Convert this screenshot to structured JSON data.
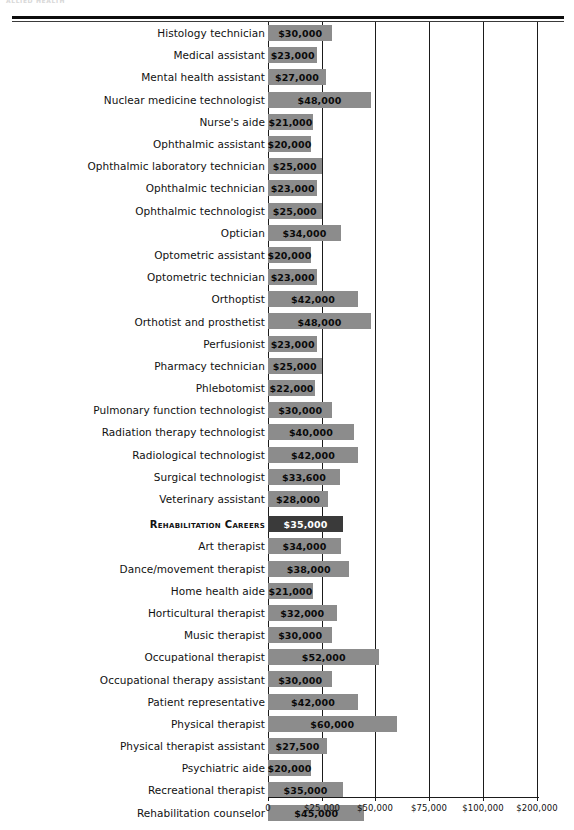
{
  "page": {
    "running_head": "ALLIED HEALTH"
  },
  "chart_data": {
    "type": "bar",
    "orientation": "horizontal",
    "title": "",
    "xlabel": "",
    "ylabel": "",
    "grid": true,
    "legend": null,
    "axis_ticks": [
      {
        "label": "0",
        "value": 0,
        "x": 268
      },
      {
        "label": "$25,000",
        "value": 25000,
        "x": 322
      },
      {
        "label": "$50,000",
        "value": 50000,
        "x": 375
      },
      {
        "label": "$75,000",
        "value": 75000,
        "x": 429
      },
      {
        "label": "$100,000",
        "value": 100000,
        "x": 483
      },
      {
        "label": "$200,000",
        "value": 200000,
        "x": 537
      }
    ],
    "xlim": [
      0,
      200000
    ],
    "note_axis_break": "scale compresses between $100,000 and $200,000",
    "categories": [
      "Histology technician",
      "Medical assistant",
      "Mental health assistant",
      "Nuclear medicine technologist",
      "Nurse's aide",
      "Ophthalmic assistant",
      "Ophthalmic laboratory technician",
      "Ophthalmic technician",
      "Ophthalmic technologist",
      "Optician",
      "Optometric assistant",
      "Optometric technician",
      "Orthoptist",
      "Orthotist and prosthetist",
      "Perfusionist",
      "Pharmacy technician",
      "Phlebotomist",
      "Pulmonary function technologist",
      "Radiation therapy technologist",
      "Radiological technologist",
      "Surgical technologist",
      "Veterinary assistant",
      "Rehabilitation Careers",
      "Art therapist",
      "Dance/movement therapist",
      "Home health aide",
      "Horticultural therapist",
      "Music therapist",
      "Occupational therapist",
      "Occupational therapy assistant",
      "Patient representative",
      "Physical therapist",
      "Physical therapist assistant",
      "Psychiatric aide",
      "Recreational therapist",
      "Rehabilitation counselor"
    ],
    "values": [
      30000,
      23000,
      27000,
      48000,
      21000,
      20000,
      25000,
      23000,
      25000,
      34000,
      20000,
      23000,
      42000,
      48000,
      23000,
      25000,
      22000,
      30000,
      40000,
      42000,
      33600,
      28000,
      35000,
      34000,
      38000,
      21000,
      32000,
      30000,
      52000,
      30000,
      42000,
      60000,
      27500,
      20000,
      35000,
      45000
    ]
  },
  "rows": [
    {
      "label": "Histology technician",
      "value": 30000,
      "value_label": "$30,000",
      "highlight": false,
      "spaced": false
    },
    {
      "label": "Medical assistant",
      "value": 23000,
      "value_label": "$23,000",
      "highlight": false,
      "spaced": false
    },
    {
      "label": "Mental health assistant",
      "value": 27000,
      "value_label": "$27,000",
      "highlight": false,
      "spaced": false
    },
    {
      "label": "Nuclear medicine technologist",
      "value": 48000,
      "value_label": "$48,000",
      "highlight": false,
      "spaced": false
    },
    {
      "label": "Nurse's aide",
      "value": 21000,
      "value_label": "$21,000",
      "highlight": false,
      "spaced": false
    },
    {
      "label": "Ophthalmic assistant",
      "value": 20000,
      "value_label": "$20,000",
      "highlight": false,
      "spaced": false
    },
    {
      "label": "Ophthalmic laboratory technician",
      "value": 25000,
      "value_label": "$25,000",
      "highlight": false,
      "spaced": false
    },
    {
      "label": "Ophthalmic technician",
      "value": 23000,
      "value_label": "$23,000",
      "highlight": false,
      "spaced": false
    },
    {
      "label": "Ophthalmic technologist",
      "value": 25000,
      "value_label": "$25,000",
      "highlight": false,
      "spaced": false
    },
    {
      "label": "Optician",
      "value": 34000,
      "value_label": "$34,000",
      "highlight": false,
      "spaced": false
    },
    {
      "label": "Optometric assistant",
      "value": 20000,
      "value_label": "$20,000",
      "highlight": false,
      "spaced": false
    },
    {
      "label": "Optometric technician",
      "value": 23000,
      "value_label": "$23,000",
      "highlight": false,
      "spaced": false
    },
    {
      "label": "Orthoptist",
      "value": 42000,
      "value_label": "$42,000",
      "highlight": false,
      "spaced": false
    },
    {
      "label": "Orthotist and prosthetist",
      "value": 48000,
      "value_label": "$48,000",
      "highlight": false,
      "spaced": false
    },
    {
      "label": "Perfusionist",
      "value": 23000,
      "value_label": "$23,000",
      "highlight": false,
      "spaced": false
    },
    {
      "label": "Pharmacy technician",
      "value": 25000,
      "value_label": "$25,000",
      "highlight": false,
      "spaced": false
    },
    {
      "label": "Phlebotomist",
      "value": 22000,
      "value_label": "$22,000",
      "highlight": false,
      "spaced": false
    },
    {
      "label": "Pulmonary function technologist",
      "value": 30000,
      "value_label": "$30,000",
      "highlight": false,
      "spaced": false
    },
    {
      "label": "Radiation therapy technologist",
      "value": 40000,
      "value_label": "$40,000",
      "highlight": false,
      "spaced": false
    },
    {
      "label": "Radiological technologist",
      "value": 42000,
      "value_label": "$42,000",
      "highlight": false,
      "spaced": false
    },
    {
      "label": "Surgical technologist",
      "value": 33600,
      "value_label": "$33,600",
      "highlight": false,
      "spaced": false
    },
    {
      "label": "Veterinary assistant",
      "value": 28000,
      "value_label": "$28,000",
      "highlight": false,
      "spaced": false
    },
    {
      "label": "Rehabilitation Careers",
      "value": 35000,
      "value_label": "$35,000",
      "highlight": true,
      "spaced": true
    },
    {
      "label": "Art therapist",
      "value": 34000,
      "value_label": "$34,000",
      "highlight": false,
      "spaced": false
    },
    {
      "label": "Dance/movement therapist",
      "value": 38000,
      "value_label": "$38,000",
      "highlight": false,
      "spaced": false
    },
    {
      "label": "Home health aide",
      "value": 21000,
      "value_label": "$21,000",
      "highlight": false,
      "spaced": false
    },
    {
      "label": "Horticultural therapist",
      "value": 32000,
      "value_label": "$32,000",
      "highlight": false,
      "spaced": false
    },
    {
      "label": "Music therapist",
      "value": 30000,
      "value_label": "$30,000",
      "highlight": false,
      "spaced": false
    },
    {
      "label": "Occupational therapist",
      "value": 52000,
      "value_label": "$52,000",
      "highlight": false,
      "spaced": false
    },
    {
      "label": "Occupational therapy assistant",
      "value": 30000,
      "value_label": "$30,000",
      "highlight": false,
      "spaced": false
    },
    {
      "label": "Patient representative",
      "value": 42000,
      "value_label": "$42,000",
      "highlight": false,
      "spaced": false
    },
    {
      "label": "Physical therapist",
      "value": 60000,
      "value_label": "$60,000",
      "highlight": false,
      "spaced": false
    },
    {
      "label": "Physical therapist assistant",
      "value": 27500,
      "value_label": "$27,500",
      "highlight": false,
      "spaced": false
    },
    {
      "label": "Psychiatric aide",
      "value": 20000,
      "value_label": "$20,000",
      "highlight": false,
      "spaced": false
    },
    {
      "label": "Recreational therapist",
      "value": 35000,
      "value_label": "$35,000",
      "highlight": false,
      "spaced": false
    },
    {
      "label": "Rehabilitation counselor",
      "value": 45000,
      "value_label": "$45,000",
      "highlight": false,
      "spaced": false
    }
  ],
  "colors": {
    "bar": "#8c8c8c",
    "bar_highlight": "#3a3a3a",
    "rule": "#0d0d0d",
    "text": "#111111"
  }
}
